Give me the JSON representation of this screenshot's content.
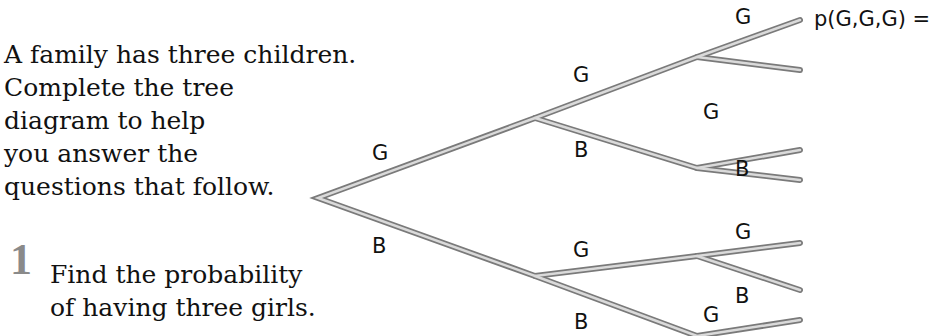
{
  "intro": {
    "lines": [
      "A family has three children.",
      "Complete the tree",
      "diagram to help",
      "you answer the",
      "questions that follow."
    ]
  },
  "question": {
    "number": "1",
    "lines": [
      "Find the probability",
      "of having three girls."
    ]
  },
  "tree": {
    "level1": {
      "top": "G",
      "bottom": "B"
    },
    "level2": {
      "g_top": "G",
      "g_bottom": "B",
      "b_top": "G",
      "b_bottom": "B"
    },
    "level3": {
      "gg_top": "G",
      "gb_top": "G",
      "gb_bottom": "B",
      "bg_top": "G",
      "bg_bottom": "B",
      "bb_top": "G"
    },
    "result_gg_g": "p(G,G,G) ="
  },
  "colors": {
    "branch_outer": "#7a7a7a",
    "branch_inner": "#d9d9d9",
    "question_number": "#8a8a8a"
  }
}
